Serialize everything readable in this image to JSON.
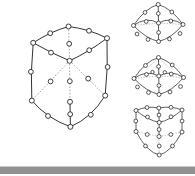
{
  "figure": {
    "background_color": "#ffffff",
    "width": 195,
    "height": 176,
    "node_style": {
      "shape": "open-circle",
      "fill_color": "#ffffff",
      "stroke_color": "#1c1c1c"
    },
    "edge_styles": {
      "visible_label": "solid",
      "hidden_label": "dashed",
      "visible_color": "#1c1c1c",
      "hidden_color": "#8c8c8c"
    },
    "panels": [
      {
        "id": "panel-main-cube",
        "name": "large-cube-drawing",
        "caption": "",
        "position": "left",
        "node_count": 20,
        "corner_count": 8,
        "midpoint_count": 12,
        "node_radius": 2.3,
        "corners": [
          [
            68.5,
            26.5
          ],
          [
            33.0,
            43.0
          ],
          [
            107.0,
            38.0
          ],
          [
            70.0,
            60.5
          ],
          [
            31.5,
            101.0
          ],
          [
            70.5,
            127.0
          ],
          [
            105.0,
            96.0
          ],
          [
            70.0,
            102.0
          ]
        ],
        "edges": [
          {
            "from": [
              68.5,
              26.5
            ],
            "to": [
              33.0,
              43.0
            ],
            "hidden": false,
            "mid": [
              50.0,
              33.0
            ]
          },
          {
            "from": [
              68.5,
              26.5
            ],
            "to": [
              107.0,
              38.0
            ],
            "hidden": false,
            "mid": [
              89.0,
              30.5
            ]
          },
          {
            "from": [
              68.5,
              26.5
            ],
            "to": [
              70.0,
              60.5
            ],
            "hidden": true,
            "mid": [
              69.2,
              43.5
            ]
          },
          {
            "from": [
              33.0,
              43.0
            ],
            "to": [
              70.0,
              60.5
            ],
            "hidden": false,
            "mid": [
              50.0,
              52.5
            ]
          },
          {
            "from": [
              107.0,
              38.0
            ],
            "to": [
              70.0,
              60.5
            ],
            "hidden": false,
            "mid": [
              89.5,
              50.0
            ]
          },
          {
            "from": [
              33.0,
              43.0
            ],
            "to": [
              31.5,
              101.0
            ],
            "hidden": false,
            "mid": [
              31.0,
              72.0
            ]
          },
          {
            "from": [
              107.0,
              38.0
            ],
            "to": [
              105.0,
              96.0
            ],
            "hidden": false,
            "mid": [
              107.5,
              67.0
            ]
          },
          {
            "from": [
              70.0,
              60.5
            ],
            "to": [
              70.0,
              102.0
            ],
            "hidden": true,
            "mid": [
              70.0,
              81.0
            ]
          },
          {
            "from": [
              31.5,
              101.0
            ],
            "to": [
              70.0,
              102.0
            ],
            "hidden": true,
            "mid": [
              50.0,
              102.5
            ]
          },
          {
            "from": [
              105.0,
              96.0
            ],
            "to": [
              70.0,
              102.0
            ],
            "hidden": true,
            "mid": [
              88.0,
              100.5
            ]
          },
          {
            "from": [
              31.5,
              101.0
            ],
            "to": [
              70.5,
              127.0
            ],
            "hidden": false,
            "mid": [
              48.0,
              117.0
            ]
          },
          {
            "from": [
              105.0,
              96.0
            ],
            "to": [
              70.5,
              127.0
            ],
            "hidden": false,
            "mid": [
              90.0,
              116.5
            ]
          },
          {
            "from": [
              70.0,
              102.0
            ],
            "to": [
              70.5,
              127.0
            ],
            "hidden": false,
            "mid": [
              69.5,
              114.0
            ]
          }
        ]
      },
      {
        "id": "panel-top-right",
        "name": "cube-diagonal-view-upper",
        "caption": "",
        "position": "top-right",
        "node_count": 20,
        "node_radius": 1.8
      },
      {
        "id": "panel-middle-right",
        "name": "cube-diagonal-view-middle",
        "caption": "",
        "position": "middle-right",
        "node_count": 20,
        "node_radius": 1.8
      },
      {
        "id": "panel-bottom-right",
        "name": "cube-corner-view-lower",
        "caption": "",
        "position": "bottom-right",
        "node_count": 20,
        "node_radius": 1.8
      }
    ],
    "bottom_band": {
      "name": "page-edge-band",
      "color": "#909090",
      "highlight_color": "#c9c9c9",
      "top": 167,
      "height": 7
    }
  }
}
